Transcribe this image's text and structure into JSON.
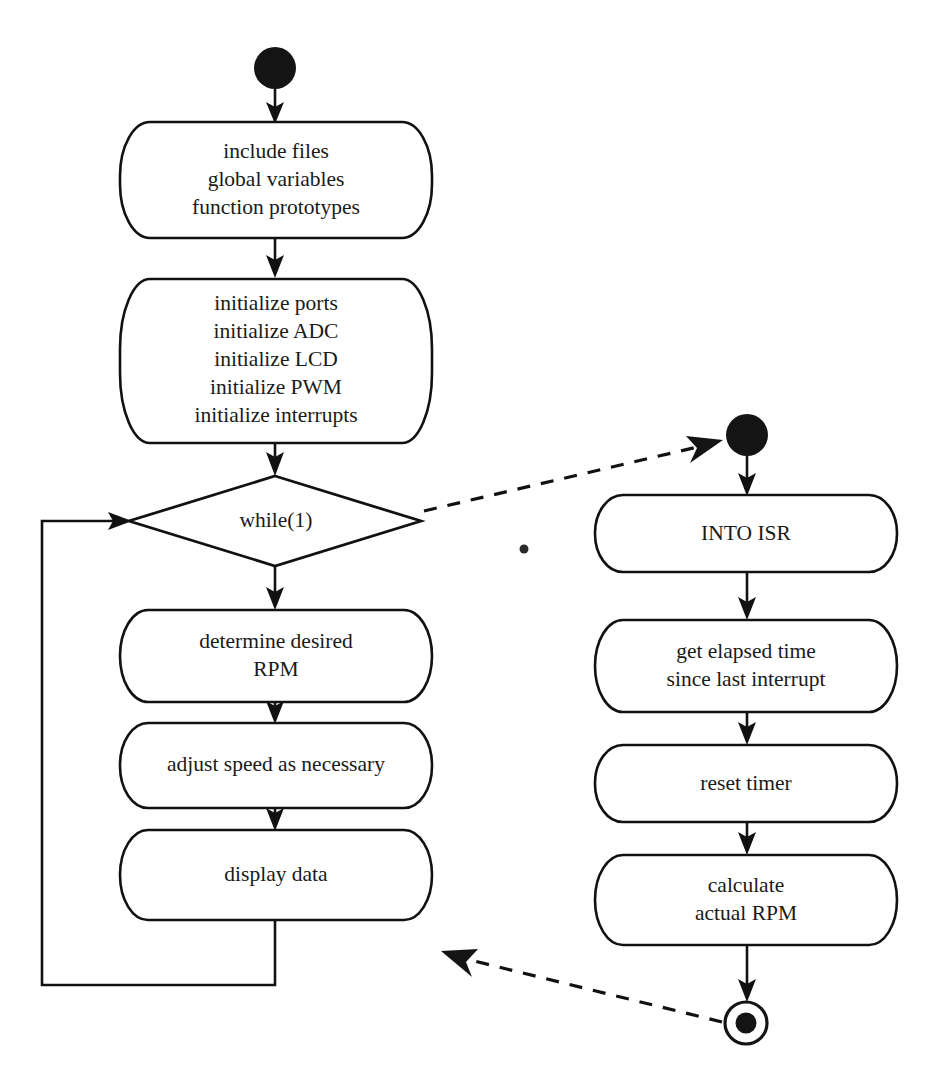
{
  "diagram": {
    "type": "uml-activity-diagram",
    "background_color": "#ffffff",
    "line_color": "#111111",
    "text_color": "#1a1a1a",
    "swimlanes": [
      {
        "name": "main-program",
        "side": "left"
      },
      {
        "name": "int0-interrupt-service-routine",
        "side": "right"
      }
    ],
    "nodes": {
      "main_start": {
        "kind": "initial-node",
        "label": ""
      },
      "setup_declarations": {
        "kind": "action",
        "lines": [
          "include files",
          "global variables",
          "function prototypes"
        ]
      },
      "initializations": {
        "kind": "action",
        "lines": [
          "initialize ports",
          "initialize ADC",
          "initialize LCD",
          "initialize PWM",
          "initialize interrupts"
        ]
      },
      "while_loop": {
        "kind": "decision",
        "lines": [
          "while(1)"
        ]
      },
      "determine_rpm": {
        "kind": "action",
        "lines": [
          "determine desired",
          "RPM"
        ]
      },
      "adjust_speed": {
        "kind": "action",
        "lines": [
          "adjust speed as necessary"
        ]
      },
      "display_data": {
        "kind": "action",
        "lines": [
          "display data"
        ]
      },
      "isr_start": {
        "kind": "initial-node",
        "label": ""
      },
      "isr_entry": {
        "kind": "action",
        "lines": [
          "INTO ISR"
        ]
      },
      "get_elapsed_time": {
        "kind": "action",
        "lines": [
          "get elapsed time",
          "since last interrupt"
        ]
      },
      "reset_timer": {
        "kind": "action",
        "lines": [
          "reset timer"
        ]
      },
      "calculate_rpm": {
        "kind": "action",
        "lines": [
          "calculate",
          "actual RPM"
        ]
      },
      "isr_end": {
        "kind": "final-node",
        "label": ""
      }
    },
    "edges": [
      {
        "from": "main_start",
        "to": "setup_declarations",
        "style": "solid"
      },
      {
        "from": "setup_declarations",
        "to": "initializations",
        "style": "solid"
      },
      {
        "from": "initializations",
        "to": "while_loop",
        "style": "solid"
      },
      {
        "from": "while_loop",
        "to": "determine_rpm",
        "style": "solid"
      },
      {
        "from": "determine_rpm",
        "to": "adjust_speed",
        "style": "solid"
      },
      {
        "from": "adjust_speed",
        "to": "display_data",
        "style": "solid"
      },
      {
        "from": "display_data",
        "to": "while_loop",
        "style": "solid",
        "routing": "loop-back-left"
      },
      {
        "from": "while_loop",
        "to": "isr_start",
        "style": "dashed"
      },
      {
        "from": "isr_start",
        "to": "isr_entry",
        "style": "solid"
      },
      {
        "from": "isr_entry",
        "to": "get_elapsed_time",
        "style": "solid"
      },
      {
        "from": "get_elapsed_time",
        "to": "reset_timer",
        "style": "solid"
      },
      {
        "from": "reset_timer",
        "to": "calculate_rpm",
        "style": "solid"
      },
      {
        "from": "calculate_rpm",
        "to": "isr_end",
        "style": "solid"
      },
      {
        "from": "isr_end",
        "to": "display_data",
        "style": "dashed"
      }
    ]
  }
}
